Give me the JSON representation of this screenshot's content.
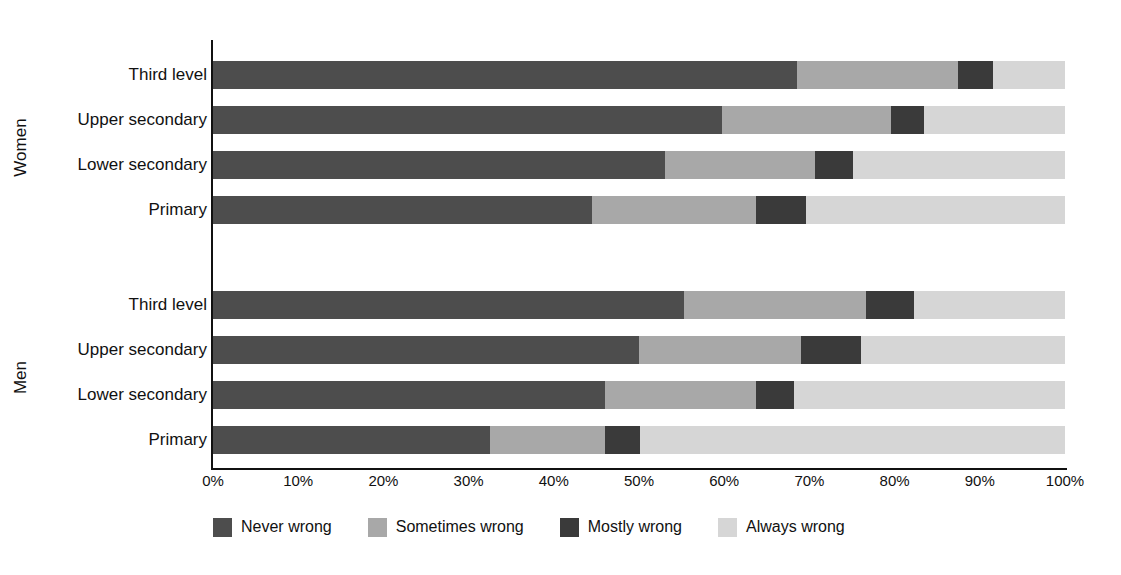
{
  "chart_data": {
    "type": "bar",
    "orientation": "horizontal",
    "stacked": true,
    "normalized": true,
    "title": "",
    "xlabel": "",
    "ylabel": "",
    "xlim": [
      0,
      100
    ],
    "grid": true,
    "legend_position": "bottom",
    "xticks": [
      "0%",
      "10%",
      "20%",
      "30%",
      "40%",
      "50%",
      "60%",
      "70%",
      "80%",
      "90%",
      "100%"
    ],
    "xtick_values": [
      0,
      10,
      20,
      30,
      40,
      50,
      60,
      70,
      80,
      90,
      100
    ],
    "series": [
      {
        "name": "Never wrong",
        "color": "#4d4d4d"
      },
      {
        "name": "Sometimes wrong",
        "color": "#a8a8a8"
      },
      {
        "name": "Mostly wrong",
        "color": "#3a3a3a"
      },
      {
        "name": "Always wrong",
        "color": "#d6d6d6"
      }
    ],
    "groups": [
      {
        "name": "Women",
        "categories": [
          {
            "label": "Third level",
            "values": [
              68.5,
              18.9,
              4.1,
              8.5
            ]
          },
          {
            "label": "Upper secondary",
            "values": [
              59.8,
              19.8,
              3.8,
              16.6
            ]
          },
          {
            "label": "Lower secondary",
            "values": [
              53.0,
              17.7,
              4.4,
              24.9
            ]
          },
          {
            "label": "Primary",
            "values": [
              44.5,
              19.2,
              5.9,
              30.4
            ]
          }
        ]
      },
      {
        "name": "Men",
        "categories": [
          {
            "label": "Third level",
            "values": [
              55.3,
              21.3,
              5.7,
              17.7
            ]
          },
          {
            "label": "Upper secondary",
            "values": [
              50.0,
              19.0,
              7.0,
              24.0
            ]
          },
          {
            "label": "Lower secondary",
            "values": [
              46.0,
              17.7,
              4.5,
              31.8
            ]
          },
          {
            "label": "Primary",
            "values": [
              32.5,
              13.5,
              4.1,
              49.9
            ]
          }
        ]
      }
    ]
  }
}
